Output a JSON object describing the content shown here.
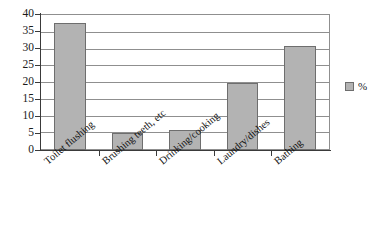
{
  "chart_data": {
    "type": "bar",
    "title": "",
    "subtitle": "",
    "xlabel": "",
    "ylabel": "",
    "categories": [
      "Toilet flushing",
      "Brushing teeth, etc",
      "Drinking/cooking",
      "Laundry/dishes",
      "Bathing"
    ],
    "values": [
      38,
      5,
      6,
      20,
      31
    ],
    "series": [
      {
        "name": "%",
        "values": [
          38,
          5,
          6,
          20,
          31
        ]
      }
    ],
    "ylim": [
      0,
      40
    ],
    "ytick_step": 5,
    "ytick_labels": [
      "0",
      "5",
      "10",
      "15",
      "20",
      "25",
      "30",
      "35",
      "40"
    ],
    "grid": true,
    "grid_axis": "y",
    "legend_position": "right",
    "legend_entries": [
      "%"
    ],
    "bar_color": "#b3b3b3",
    "bar_border_color": "#6e6e6e",
    "grid_color": "#8f8f8f",
    "axis_color": "#3a3a3a",
    "background": "#ffffff"
  },
  "legend": {
    "entry_label": "%",
    "swatch_name": "percent-series-swatch"
  }
}
